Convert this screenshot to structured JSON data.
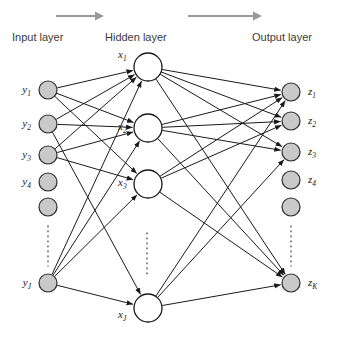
{
  "figure": {
    "width": 338,
    "height": 342,
    "background": "#ffffff"
  },
  "colors": {
    "node_fill_io": "#c9c9c9",
    "node_stroke_io": "#2b2b2b",
    "node_fill_hidden": "#ffffff",
    "node_stroke_hidden": "#1a1a1a",
    "edge": "#1a1a1a",
    "flow_arrow": "#9a9a9a",
    "label_text": "#3b3b3b",
    "node_label_text": "#1a1a1a",
    "ellipsis": "#555555"
  },
  "headers": {
    "input": {
      "text": "Input layer",
      "x": 12,
      "y": 41
    },
    "hidden": {
      "text": "Hidden layer",
      "x": 105,
      "y": 41
    },
    "output": {
      "text": "Output layer",
      "x": 252,
      "y": 41
    }
  },
  "flow_arrows": [
    {
      "name": "input-to-hidden-flow-arrow",
      "x1": 56,
      "y1": 16,
      "x2": 104,
      "y2": 16
    },
    {
      "name": "hidden-to-output-flow-arrow",
      "x1": 188,
      "y1": 16,
      "x2": 262,
      "y2": 16
    }
  ],
  "layers": {
    "input": {
      "name": "input-layer",
      "cx": 48,
      "radius": 9,
      "label_dx": -17,
      "nodes": [
        {
          "id": "y1",
          "cy": 90,
          "base": "y",
          "sub": "1",
          "labeled": true
        },
        {
          "id": "y2",
          "cy": 124,
          "base": "y",
          "sub": "2",
          "labeled": true
        },
        {
          "id": "y3",
          "cy": 155,
          "base": "y",
          "sub": "3",
          "labeled": true
        },
        {
          "id": "y4",
          "cy": 182,
          "base": "y",
          "sub": "4",
          "labeled": true
        },
        {
          "id": "y5",
          "cy": 207,
          "base": "",
          "sub": "",
          "labeled": false
        },
        {
          "id": "yJ",
          "cy": 283,
          "base": "y",
          "sub": "J",
          "labeled": true
        }
      ],
      "ellipsis": {
        "x": 48,
        "y1": 226,
        "y2": 266
      }
    },
    "hidden": {
      "name": "hidden-layer",
      "cx": 148,
      "radius": 14,
      "nodes": [
        {
          "id": "x1",
          "cy": 67,
          "base": "x",
          "sub": "1",
          "label_dx": -30,
          "label_dy": -9,
          "labeled": true
        },
        {
          "id": "x2",
          "cy": 128,
          "base": "x",
          "sub": "2",
          "label_dx": -30,
          "label_dy": 2,
          "labeled": true
        },
        {
          "id": "x3",
          "cy": 184,
          "base": "x",
          "sub": "3",
          "label_dx": -30,
          "label_dy": 2,
          "labeled": true
        },
        {
          "id": "xJ",
          "cy": 308,
          "base": "x",
          "sub": "J",
          "label_dx": -30,
          "label_dy": 10,
          "labeled": true
        }
      ],
      "ellipsis": {
        "x": 147,
        "y1": 233,
        "y2": 277
      }
    },
    "output": {
      "name": "output-layer",
      "cx": 291,
      "radius": 9,
      "label_dx": 17,
      "nodes": [
        {
          "id": "z1",
          "cy": 92,
          "base": "z",
          "sub": "1",
          "labeled": true
        },
        {
          "id": "z2",
          "cy": 121,
          "base": "z",
          "sub": "2",
          "labeled": true
        },
        {
          "id": "z3",
          "cy": 152,
          "base": "z",
          "sub": "3",
          "labeled": true
        },
        {
          "id": "z4",
          "cy": 180,
          "base": "z",
          "sub": "4",
          "labeled": true
        },
        {
          "id": "z5",
          "cy": 207,
          "base": "",
          "sub": "",
          "labeled": false
        },
        {
          "id": "zK",
          "cy": 283,
          "base": "z",
          "sub": "K",
          "labeled": true
        }
      ],
      "ellipsis": {
        "x": 291,
        "y1": 226,
        "y2": 266
      }
    }
  },
  "edges": {
    "input_to_hidden": [
      [
        "y1",
        "x1"
      ],
      [
        "y1",
        "x2"
      ],
      [
        "y1",
        "x3"
      ],
      [
        "y2",
        "x1"
      ],
      [
        "y2",
        "x2"
      ],
      [
        "y2",
        "xJ"
      ],
      [
        "y3",
        "x1"
      ],
      [
        "y3",
        "x2"
      ],
      [
        "y3",
        "x3"
      ],
      [
        "yJ",
        "x1"
      ],
      [
        "yJ",
        "x2"
      ],
      [
        "yJ",
        "x3"
      ],
      [
        "yJ",
        "xJ"
      ]
    ],
    "hidden_to_output": [
      [
        "x1",
        "z1"
      ],
      [
        "x1",
        "z2"
      ],
      [
        "x1",
        "z3"
      ],
      [
        "x1",
        "zK"
      ],
      [
        "x2",
        "z1"
      ],
      [
        "x2",
        "z2"
      ],
      [
        "x2",
        "z3"
      ],
      [
        "x2",
        "zK"
      ],
      [
        "x3",
        "z1"
      ],
      [
        "x3",
        "z2"
      ],
      [
        "x3",
        "zK"
      ],
      [
        "xJ",
        "z1"
      ],
      [
        "xJ",
        "z3"
      ],
      [
        "xJ",
        "zK"
      ]
    ]
  }
}
